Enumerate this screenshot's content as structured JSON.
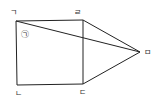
{
  "diagram": {
    "type": "geometry",
    "points": {
      "A": {
        "label": "ㄱ"
      },
      "L": {
        "label": "ㄴ"
      },
      "D": {
        "label": "ㄷ"
      },
      "R": {
        "label": "ㄹ"
      },
      "M": {
        "label": "ㅁ"
      }
    },
    "angle_mark": {
      "label": "㉠",
      "at": "ㄱ"
    },
    "segments": [
      [
        "ㄱ",
        "ㄹ"
      ],
      [
        "ㄱ",
        "ㄴ"
      ],
      [
        "ㄴ",
        "ㄷ"
      ],
      [
        "ㄷ",
        "ㄹ"
      ],
      [
        "ㄹ",
        "ㅁ"
      ],
      [
        "ㄷ",
        "ㅁ"
      ],
      [
        "ㄱ",
        "ㅁ"
      ]
    ]
  }
}
